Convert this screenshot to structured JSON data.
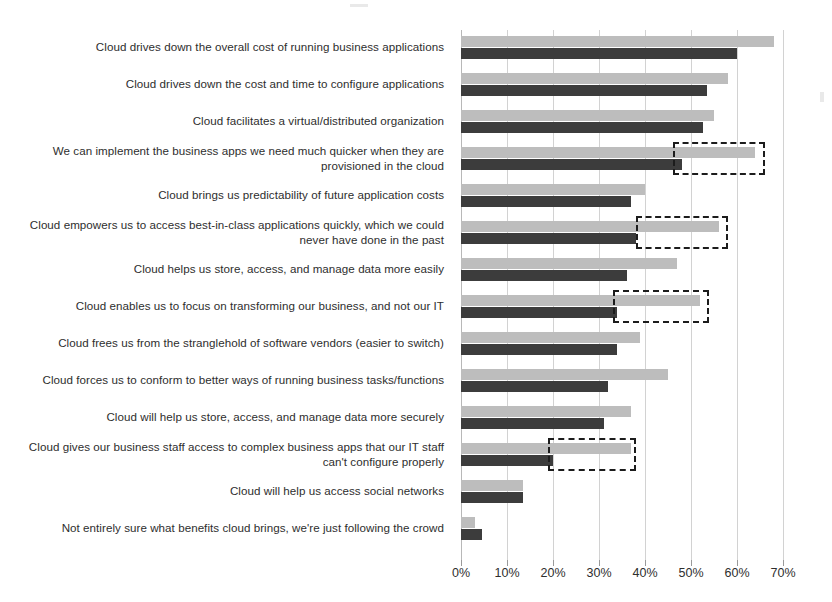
{
  "chart_data": {
    "type": "bar",
    "orientation": "horizontal",
    "title": "",
    "subtitle": "",
    "xlabel": "",
    "ylabel": "",
    "xlim": [
      0,
      70
    ],
    "grid": true,
    "legend_position": "none",
    "tick_labels": [
      "0%",
      "10%",
      "20%",
      "30%",
      "40%",
      "50%",
      "60%",
      "70%"
    ],
    "tick_values": [
      0,
      10,
      20,
      30,
      40,
      50,
      60,
      70
    ],
    "categories": [
      "Cloud drives down the overall cost of running business applications",
      "Cloud drives down the cost and time to configure applications",
      "Cloud facilitates a virtual/distributed organization",
      "We can implement the business apps we need much quicker when they are provisioned in the cloud",
      "Cloud brings us predictability of future application costs",
      "Cloud empowers us to access best-in-class applications quickly, which we could never have done in the past",
      "Cloud helps us store, access, and manage data more easily",
      "Cloud enables us to focus on transforming our business, and not our IT",
      "Cloud frees us from the stranglehold of software vendors (easier to switch)",
      "Cloud forces us to conform to better ways of running business tasks/functions",
      "Cloud will help us store, access, and manage data more securely",
      "Cloud gives our business staff access to complex business apps that our IT staff can't configure properly",
      "Cloud will help us access social networks",
      "Not entirely sure what benefits cloud brings, we're just following the crowd"
    ],
    "series": [
      {
        "name": "Series 1",
        "color": "#bdbdbd",
        "values": [
          68,
          58,
          55,
          64,
          40,
          56,
          47,
          52,
          39,
          45,
          37,
          37,
          13.5,
          3
        ]
      },
      {
        "name": "Series 2",
        "color": "#3c3c3c",
        "values": [
          60,
          53.5,
          52.5,
          48,
          37,
          38,
          36,
          34,
          34,
          32,
          31,
          20,
          13.5,
          4.5
        ]
      }
    ],
    "highlights": [
      {
        "category_index": 3,
        "from": 46,
        "to": 66,
        "label": "dashed-highlight-box"
      },
      {
        "category_index": 5,
        "from": 38,
        "to": 58,
        "label": "dashed-highlight-box"
      },
      {
        "category_index": 7,
        "from": 33,
        "to": 54,
        "label": "dashed-highlight-box"
      },
      {
        "category_index": 11,
        "from": 19,
        "to": 38,
        "label": "dashed-highlight-box"
      }
    ]
  },
  "colors": {
    "series_light": "#bdbdbd",
    "series_dark": "#3c3c3c",
    "gridline": "#d2d2d2",
    "highlight_border": "#1c1c1c",
    "text": "#2e2e2e",
    "background": "#ffffff"
  }
}
